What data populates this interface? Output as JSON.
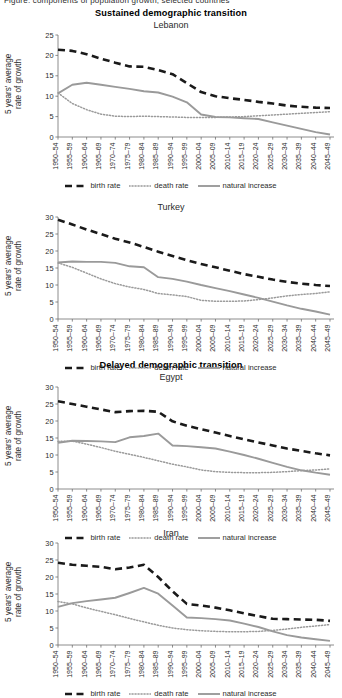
{
  "figure": {
    "cropped_top_text": "Figure: components of population growth, selected countries",
    "sections": [
      {
        "id": "sustained",
        "title": "Sustained demographic transition"
      },
      {
        "id": "delayed",
        "title": "Delayed demographic transition"
      }
    ],
    "y_axis_label": "5 years' average\nrate of growth",
    "legend": {
      "items": [
        {
          "key": "birth",
          "label": "birth rate",
          "style": "dashed",
          "color": "#1a1a1a"
        },
        {
          "key": "death",
          "label": "death rate",
          "style": "dotted",
          "color": "#9a9a9a"
        },
        {
          "key": "natural",
          "label": "natural increase",
          "style": "solid",
          "color": "#9a9a9a"
        }
      ]
    },
    "categories": [
      "1950–54",
      "1955–59",
      "1960–64",
      "1965–69",
      "1970–74",
      "1975–79",
      "1980–84",
      "1985–89",
      "1990–94",
      "1995–99",
      "2000–04",
      "2005–09",
      "2010–14",
      "2015–19",
      "2020–24",
      "2025–29",
      "2030–34",
      "2035–39",
      "2040–44",
      "2045–49"
    ]
  },
  "chart_data": [
    {
      "type": "line",
      "title": "Lebanon",
      "section": "Sustained demographic transition",
      "xlabel": "",
      "ylabel": "5 years' average rate of growth",
      "ylim": [
        0,
        25
      ],
      "yticks": [
        0,
        5,
        10,
        15,
        20,
        25
      ],
      "grid": false,
      "legend_position": "bottom",
      "categories": [
        "1950–54",
        "1955–59",
        "1960–64",
        "1965–69",
        "1970–74",
        "1975–79",
        "1980–84",
        "1985–89",
        "1990–94",
        "1995–99",
        "2000–04",
        "2005–09",
        "2010–14",
        "2015–19",
        "2020–24",
        "2025–29",
        "2030–34",
        "2035–39",
        "2040–44",
        "2045–49"
      ],
      "series": [
        {
          "name": "birth rate",
          "style": "dashed",
          "color": "#1a1a1a",
          "values": [
            21.4,
            21.1,
            20.3,
            19.2,
            18.2,
            17.3,
            17.2,
            16.4,
            15.4,
            13.2,
            11.0,
            10.0,
            9.5,
            9.1,
            8.6,
            8.2,
            7.7,
            7.4,
            7.2,
            7.1
          ]
        },
        {
          "name": "death rate",
          "style": "dotted",
          "color": "#9a9a9a",
          "values": [
            10.8,
            8.2,
            6.7,
            5.6,
            5.1,
            5.0,
            5.1,
            5.0,
            4.9,
            4.8,
            4.8,
            4.8,
            4.9,
            5.0,
            5.2,
            5.4,
            5.6,
            5.8,
            6.0,
            6.2
          ]
        },
        {
          "name": "natural increase",
          "style": "solid",
          "color": "#9a9a9a",
          "values": [
            10.7,
            12.8,
            13.3,
            12.8,
            12.3,
            11.8,
            11.2,
            10.9,
            9.9,
            8.5,
            5.5,
            4.9,
            4.8,
            4.6,
            4.4,
            3.6,
            2.8,
            2.0,
            1.2,
            0.6
          ]
        }
      ]
    },
    {
      "type": "line",
      "title": "Turkey",
      "section": "Sustained demographic transition",
      "xlabel": "",
      "ylabel": "5 years' average rate of growth",
      "ylim": [
        0,
        30
      ],
      "yticks": [
        0,
        5,
        10,
        15,
        20,
        25,
        30
      ],
      "grid": false,
      "legend_position": "bottom",
      "categories": [
        "1950–54",
        "1955–59",
        "1960–64",
        "1965–69",
        "1970–74",
        "1975–79",
        "1980–84",
        "1985–89",
        "1990–94",
        "1995–99",
        "2000–04",
        "2005–09",
        "2010–14",
        "2015–19",
        "2020–24",
        "2025–29",
        "2030–34",
        "2035–39",
        "2040–44",
        "2045–49"
      ],
      "series": [
        {
          "name": "birth rate",
          "style": "dashed",
          "color": "#1a1a1a",
          "values": [
            29.2,
            27.8,
            26.3,
            25.0,
            23.6,
            22.5,
            21.2,
            19.8,
            18.5,
            17.3,
            16.2,
            15.2,
            14.2,
            13.2,
            12.4,
            11.6,
            10.9,
            10.4,
            10.0,
            9.7
          ]
        },
        {
          "name": "death rate",
          "style": "dotted",
          "color": "#9a9a9a",
          "values": [
            16.5,
            15.2,
            13.5,
            11.8,
            10.4,
            9.4,
            8.7,
            7.5,
            7.1,
            6.6,
            5.5,
            5.2,
            5.2,
            5.3,
            5.7,
            6.2,
            6.8,
            7.2,
            7.5,
            8.0
          ]
        },
        {
          "name": "natural increase",
          "style": "solid",
          "color": "#9a9a9a",
          "values": [
            16.6,
            16.9,
            16.8,
            16.8,
            16.5,
            15.5,
            15.2,
            12.3,
            11.8,
            11.0,
            10.0,
            9.1,
            8.2,
            7.2,
            6.2,
            5.1,
            4.0,
            3.0,
            2.2,
            1.3
          ]
        }
      ]
    },
    {
      "type": "line",
      "title": "Egypt",
      "section": "Delayed demographic transition",
      "xlabel": "",
      "ylabel": "5 years' average rate of growth",
      "ylim": [
        0,
        30
      ],
      "yticks": [
        0,
        5,
        10,
        15,
        20,
        25,
        30
      ],
      "grid": false,
      "legend_position": "bottom",
      "categories": [
        "1950–54",
        "1955–59",
        "1960–64",
        "1965–69",
        "1970–74",
        "1975–79",
        "1980–84",
        "1985–89",
        "1990–94",
        "1995–99",
        "2000–04",
        "2005–09",
        "2010–14",
        "2015–19",
        "2020–24",
        "2025–29",
        "2030–34",
        "2035–39",
        "2040–44",
        "2045–49"
      ],
      "series": [
        {
          "name": "birth rate",
          "style": "dashed",
          "color": "#1a1a1a",
          "values": [
            25.8,
            25.0,
            24.2,
            23.4,
            22.6,
            22.9,
            23.0,
            22.7,
            19.9,
            18.6,
            17.6,
            16.6,
            15.6,
            14.6,
            13.7,
            12.8,
            11.9,
            11.2,
            10.5,
            9.9
          ]
        },
        {
          "name": "death rate",
          "style": "dotted",
          "color": "#9a9a9a",
          "values": [
            14.0,
            14.1,
            13.2,
            12.2,
            11.1,
            10.2,
            9.3,
            8.3,
            7.3,
            6.5,
            5.6,
            5.1,
            4.9,
            4.8,
            4.8,
            4.9,
            5.1,
            5.4,
            5.6,
            5.9
          ]
        },
        {
          "name": "natural increase",
          "style": "solid",
          "color": "#9a9a9a",
          "values": [
            13.6,
            14.2,
            14.1,
            14.0,
            13.8,
            15.2,
            15.6,
            16.3,
            12.8,
            12.6,
            12.3,
            11.9,
            11.0,
            10.0,
            8.9,
            7.7,
            6.5,
            5.5,
            4.8,
            4.2
          ]
        }
      ]
    },
    {
      "type": "line",
      "title": "Iran",
      "section": "Delayed demographic transition",
      "xlabel": "",
      "ylabel": "5 years' average rate of growth",
      "ylim": [
        0,
        30
      ],
      "yticks": [
        0,
        5,
        10,
        15,
        20,
        25,
        30
      ],
      "grid": false,
      "legend_position": "bottom",
      "categories": [
        "1950–54",
        "1955–59",
        "1960–64",
        "1965–69",
        "1970–74",
        "1975–79",
        "1980–84",
        "1985–89",
        "1990–94",
        "1995–99",
        "2000–04",
        "2005–09",
        "2010–14",
        "2015–19",
        "2020–24",
        "2025–29",
        "2030–34",
        "2035–39",
        "2040–44",
        "2045–49"
      ],
      "series": [
        {
          "name": "birth rate",
          "style": "dashed",
          "color": "#1a1a1a",
          "values": [
            24.2,
            23.6,
            23.3,
            23.0,
            22.3,
            22.8,
            23.6,
            20.0,
            15.8,
            12.1,
            11.6,
            11.0,
            10.2,
            9.3,
            8.5,
            7.7,
            7.6,
            7.5,
            7.4,
            7.1
          ]
        },
        {
          "name": "death rate",
          "style": "dotted",
          "color": "#9a9a9a",
          "values": [
            12.8,
            12.1,
            10.9,
            9.9,
            8.9,
            7.8,
            6.8,
            5.8,
            5.0,
            4.5,
            4.2,
            4.0,
            3.9,
            3.9,
            4.0,
            4.3,
            4.7,
            5.2,
            5.6,
            6.0
          ]
        },
        {
          "name": "natural increase",
          "style": "solid",
          "color": "#9a9a9a",
          "values": [
            11.2,
            12.3,
            12.9,
            13.4,
            13.9,
            15.3,
            16.8,
            15.1,
            11.6,
            8.1,
            7.9,
            7.6,
            7.2,
            6.3,
            5.3,
            4.0,
            2.9,
            2.2,
            1.7,
            1.2
          ]
        }
      ]
    }
  ]
}
